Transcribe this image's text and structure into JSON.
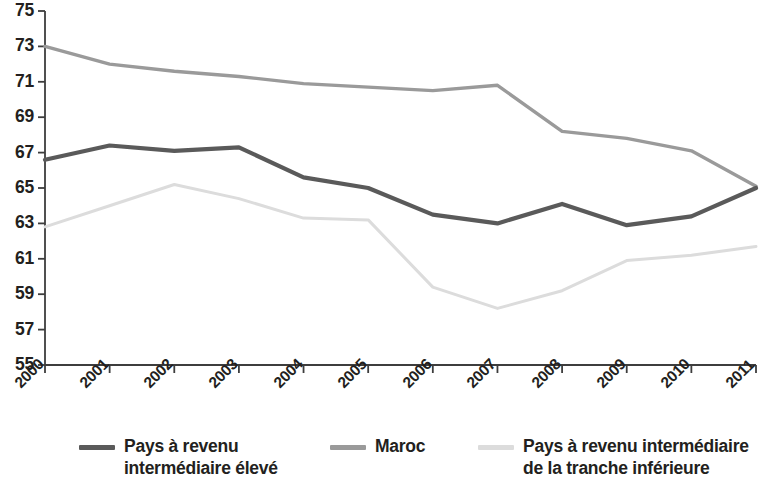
{
  "chart_data": {
    "type": "line",
    "title": "",
    "xlabel": "",
    "ylabel": "",
    "x": [
      2000,
      2001,
      2002,
      2003,
      2004,
      2005,
      2006,
      2007,
      2008,
      2009,
      2010,
      2011
    ],
    "xtick_labels": [
      "2000",
      "2001",
      "2002",
      "2003",
      "2004",
      "2005",
      "2006",
      "2007",
      "2008",
      "2009",
      "2010",
      "2011"
    ],
    "ytick_labels": [
      "75",
      "73",
      "71",
      "69",
      "67",
      "65",
      "63",
      "61",
      "59",
      "57",
      "55"
    ],
    "ytick_values": [
      75,
      73,
      71,
      69,
      67,
      65,
      63,
      61,
      59,
      57,
      55
    ],
    "ylim": [
      55,
      75
    ],
    "xlim": [
      2000,
      2011
    ],
    "grid": false,
    "legend_position": "bottom",
    "series": [
      {
        "name": "Pays à revenu intermédiaire élevé",
        "color": "#5a5a5a",
        "width": 4.2,
        "values": [
          66.6,
          67.4,
          67.1,
          67.3,
          65.6,
          65.0,
          63.5,
          63.0,
          64.1,
          62.9,
          63.4,
          65.0
        ]
      },
      {
        "name": "Maroc",
        "color": "#9a9a9a",
        "width": 3.4,
        "values": [
          73.0,
          72.0,
          71.6,
          71.3,
          70.9,
          70.7,
          70.5,
          70.8,
          68.2,
          67.8,
          67.1,
          65.1
        ]
      },
      {
        "name": "Pays à revenu intermédiaire de la tranche inférieure",
        "color": "#dcdcdc",
        "width": 3.0,
        "values": [
          62.8,
          64.0,
          65.2,
          64.4,
          63.3,
          63.2,
          59.4,
          58.2,
          59.2,
          60.9,
          61.2,
          61.7
        ]
      }
    ]
  },
  "legend": {
    "items": [
      {
        "label_line1": "Pays à revenu",
        "label_line2": "intermédiaire élevé",
        "color": "#5a5a5a"
      },
      {
        "label_line1": "Maroc",
        "label_line2": "",
        "color": "#9a9a9a"
      },
      {
        "label_line1": "Pays à revenu intermédiaire",
        "label_line2": "de la tranche inférieure",
        "color": "#dcdcdc"
      }
    ]
  },
  "axes": {
    "axis_color": "#3d3d3d"
  }
}
